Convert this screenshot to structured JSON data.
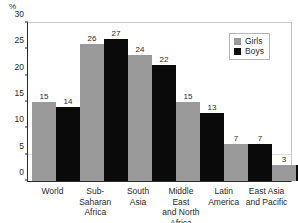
{
  "chart_data": {
    "type": "bar",
    "title": "",
    "subtitle": "",
    "xlabel": "",
    "ylabel": "%",
    "unit_label": "%",
    "ylim": [
      0,
      30
    ],
    "yticks": [
      0,
      5,
      10,
      15,
      20,
      25,
      30
    ],
    "grid": "faint horizontal gridline at 5",
    "legend_position": "top-right",
    "categories": [
      "World",
      "Sub-Saharan Africa",
      "South Asia",
      "Middle East and North Africa",
      "Latin America",
      "East Asia and Pacific"
    ],
    "category_label_lines": [
      [
        "World"
      ],
      [
        "Sub-",
        "Saharan",
        "Africa"
      ],
      [
        "South",
        "Asia"
      ],
      [
        "Middle East",
        "and North",
        "Africa"
      ],
      [
        "Latin",
        "America"
      ],
      [
        "East Asia",
        "and Pacific"
      ]
    ],
    "series": [
      {
        "name": "Girls",
        "color": "#9a9a9a",
        "values": [
          15,
          26,
          24,
          15,
          7,
          3
        ]
      },
      {
        "name": "Boys",
        "color": "#0a0a0a",
        "values": [
          14,
          27,
          22,
          13,
          7,
          3
        ]
      }
    ]
  },
  "legend": {
    "entries": [
      {
        "label": "Girls",
        "color": "#9a9a9a"
      },
      {
        "label": "Boys",
        "color": "#0a0a0a"
      }
    ]
  }
}
